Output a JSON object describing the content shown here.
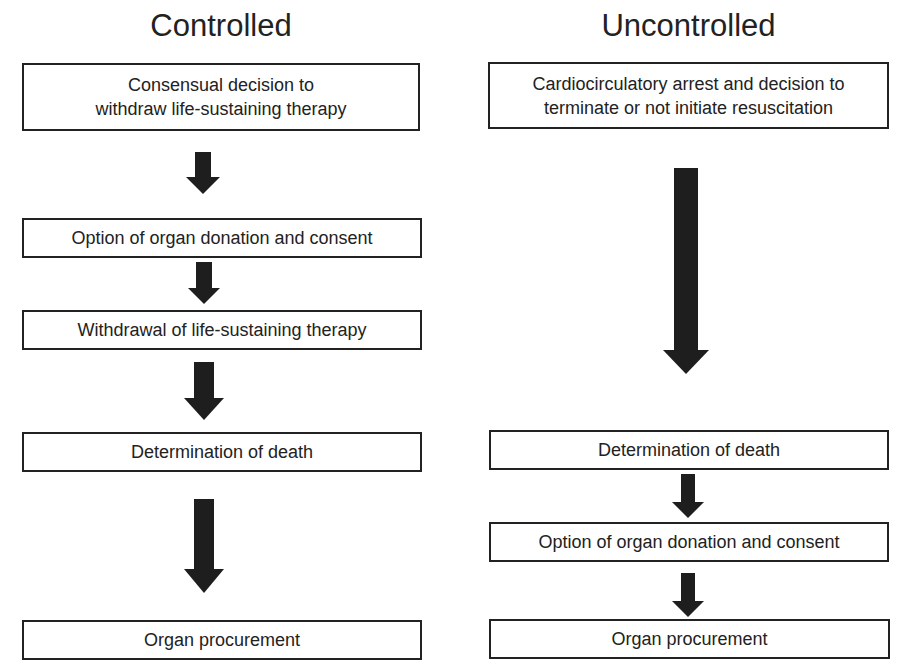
{
  "columns": [
    {
      "title": "Controlled",
      "steps": [
        "Consensual decision to\nwithdraw life-sustaining therapy",
        "Option of organ donation and consent",
        "Withdrawal of life-sustaining therapy",
        "Determination of death",
        "Organ procurement"
      ]
    },
    {
      "title": "Uncontrolled",
      "steps": [
        "Cardiocirculatory arrest and decision to\nterminate or not initiate resuscitation",
        "Determination of death",
        "Option of organ donation and consent",
        "Organ procurement"
      ]
    }
  ],
  "colors": {
    "arrow": "#1e1e1e",
    "border": "#222222",
    "background": "#ffffff"
  }
}
